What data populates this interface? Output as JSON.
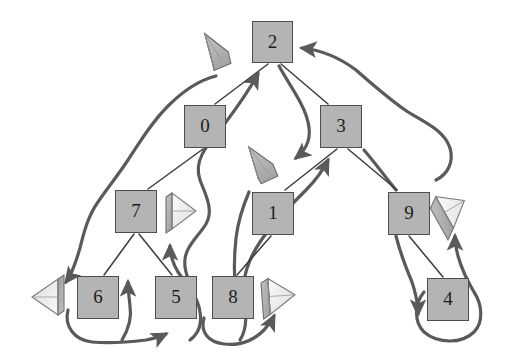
{
  "figure": {
    "kind": "binary-tree-diagram",
    "background_color": "#ffffff",
    "node_fill_color": "#b4b4b4",
    "node_stroke_color": "#4d4d4d",
    "tree_edge_color": "#3c3c3c",
    "traversal_arrow_color": "#5a5a5a",
    "cone_fill_light": "#f2f2f2",
    "cone_fill_dark": "#a9a9a9"
  },
  "nodes": [
    {
      "id": "n2",
      "label": "2",
      "x": 252,
      "y": 21,
      "w": 41,
      "h": 42
    },
    {
      "id": "n0",
      "label": "0",
      "x": 184,
      "y": 105,
      "w": 42,
      "h": 43
    },
    {
      "id": "n3",
      "label": "3",
      "x": 320,
      "y": 105,
      "w": 42,
      "h": 43
    },
    {
      "id": "n7",
      "label": "7",
      "x": 115,
      "y": 190,
      "w": 42,
      "h": 43
    },
    {
      "id": "n1",
      "label": "1",
      "x": 252,
      "y": 192,
      "w": 42,
      "h": 43
    },
    {
      "id": "n9",
      "label": "9",
      "x": 388,
      "y": 192,
      "w": 42,
      "h": 43
    },
    {
      "id": "n6",
      "label": "6",
      "x": 77,
      "y": 276,
      "w": 42,
      "h": 43
    },
    {
      "id": "n5",
      "label": "5",
      "x": 155,
      "y": 276,
      "w": 42,
      "h": 43
    },
    {
      "id": "n8",
      "label": "8",
      "x": 212,
      "y": 276,
      "w": 42,
      "h": 43
    },
    {
      "id": "n4",
      "label": "4",
      "x": 427,
      "y": 278,
      "w": 42,
      "h": 43
    }
  ],
  "tree_edges": [
    {
      "from": "n2",
      "to": "n0"
    },
    {
      "from": "n2",
      "to": "n3"
    },
    {
      "from": "n0",
      "to": "n7"
    },
    {
      "from": "n3",
      "to": "n1"
    },
    {
      "from": "n3",
      "to": "n9"
    },
    {
      "from": "n7",
      "to": "n6"
    },
    {
      "from": "n7",
      "to": "n5"
    },
    {
      "from": "n1",
      "to": "n8"
    },
    {
      "from": "n9",
      "to": "n4"
    }
  ],
  "cones": [
    {
      "id": "cone-top-left",
      "cx": 222,
      "cy": 52,
      "dir": "left-down"
    },
    {
      "id": "cone-mid-center",
      "cx": 268,
      "cy": 167,
      "dir": "left-down"
    },
    {
      "id": "cone-left-of-7",
      "cx": 180,
      "cy": 211,
      "dir": "right"
    },
    {
      "id": "cone-far-left",
      "cx": 50,
      "cy": 297,
      "dir": "left"
    },
    {
      "id": "cone-right-of-8",
      "cx": 277,
      "cy": 296,
      "dir": "right"
    },
    {
      "id": "cone-right-of-9",
      "cx": 450,
      "cy": 212,
      "dir": "right-up"
    }
  ],
  "traversal_arrows": [
    {
      "id": "arrow-into-2-from-left",
      "note": "curve rising from lower-left to node 2 top area"
    },
    {
      "id": "arrow-into-2-from-right",
      "note": "curve rising along right side into node 2 right edge"
    },
    {
      "id": "arrow-down-to-cone-mid",
      "note": "curve from node 2 bottom sweeping right then down to center cone"
    },
    {
      "id": "arrow-to-far-left-cone",
      "note": "long curve from upper area down to far-left cone"
    },
    {
      "id": "arrow-loop-6-to-5",
      "note": "loop under node 6 sweeping right, arrowhead pointing down-right"
    },
    {
      "id": "arrow-up-into-7-left",
      "note": "short arrow rising into node 7 bottom from below-left"
    },
    {
      "id": "arrow-up-into-7-right",
      "note": "curve rising from node 5 region up into node 7 bottom-right"
    },
    {
      "id": "arrow-loop-8-right",
      "note": "loop under node 8 curving right and up into the cone right of 8"
    },
    {
      "id": "arrow-up-into-3",
      "note": "curve rising from node 8 region up into node 3 bottom"
    },
    {
      "id": "arrow-9-down-to-4",
      "note": "curve from node 9 bottom down to left of node 4 with arrowhead"
    },
    {
      "id": "arrow-loop-4-up",
      "note": "loop around node 4 rising into the cone right of node 9"
    }
  ]
}
